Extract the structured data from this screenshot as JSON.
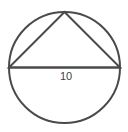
{
  "figure": {
    "background_color": "#ffffff",
    "stroke_color": "#4a4a4a",
    "label_color": "#3f3f3f",
    "stroke_width": 2,
    "circle": {
      "center_x": 64.5,
      "center_y": 67.5,
      "radius": 55.5
    },
    "chord": {
      "label": "10",
      "x1": 9,
      "y1": 67.5,
      "x2": 120,
      "y2": 67.5
    },
    "triangle": {
      "apex_x": 64.5,
      "apex_y": 12,
      "left_x": 9,
      "left_y": 67.5,
      "right_x": 120,
      "right_y": 67.5,
      "points": "64.5,12 9,67.5 120,67.5"
    },
    "label_position": {
      "x": 66,
      "y": 80
    }
  }
}
